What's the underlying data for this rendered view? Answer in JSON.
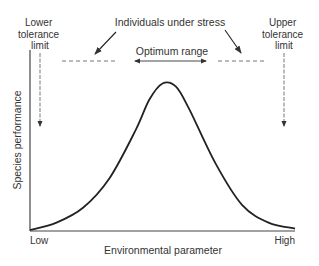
{
  "chart_data": {
    "type": "line",
    "title": "",
    "xlabel": "Environmental parameter",
    "ylabel": "Species performance",
    "x_tick_labels": [
      "Low",
      "High"
    ],
    "xlim": [
      0,
      1
    ],
    "ylim": [
      0,
      1
    ],
    "grid": false,
    "series": [
      {
        "name": "Species performance curve",
        "x": [
          0.0,
          0.1,
          0.2,
          0.3,
          0.4,
          0.45,
          0.5,
          0.55,
          0.6,
          0.7,
          0.8,
          0.9,
          1.0
        ],
        "y": [
          0.0,
          0.05,
          0.15,
          0.35,
          0.68,
          0.88,
          0.99,
          0.97,
          0.82,
          0.45,
          0.17,
          0.05,
          0.01
        ]
      }
    ],
    "annotations": {
      "lower_tolerance": "Lower\ntolerance\nlimit",
      "lower_tolerance_lines": [
        "Lower",
        "tolerance",
        "limit"
      ],
      "upper_tolerance_lines": [
        "Upper",
        "tolerance",
        "limit"
      ],
      "stress": "Individuals under stress",
      "optimum": "Optimum range"
    }
  }
}
